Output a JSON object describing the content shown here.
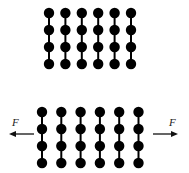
{
  "diagram": {
    "top_panel": {
      "columns": 6,
      "beads_per_column": 4,
      "state": "unstretched"
    },
    "bottom_panel": {
      "columns": 6,
      "beads_per_column": 4,
      "state": "pulled apart",
      "force_left": {
        "label": "F",
        "direction": "left"
      },
      "force_right": {
        "label": "F",
        "direction": "right"
      }
    },
    "colors": {
      "bead": "#000000",
      "link": "#000000",
      "arrow": "#111111"
    }
  }
}
